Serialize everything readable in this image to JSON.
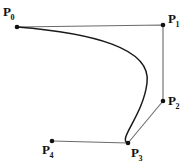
{
  "figure": {
    "type": "bezier-curve-diagram",
    "width": 187,
    "height": 167,
    "background_color": "#ffffff",
    "curve_color": "#1a1a1a",
    "polygon_color": "#6b6b6b",
    "point_color": "#111111",
    "points": [
      {
        "id": "P0",
        "letter": "P",
        "subscript": "0",
        "x": 17,
        "y": 27
      },
      {
        "id": "P1",
        "letter": "P",
        "subscript": "1",
        "x": 163,
        "y": 25
      },
      {
        "id": "P2",
        "letter": "P",
        "subscript": "2",
        "x": 163,
        "y": 101
      },
      {
        "id": "P3",
        "letter": "P",
        "subscript": "3",
        "x": 128,
        "y": 143
      },
      {
        "id": "P4",
        "letter": "P",
        "subscript": "4",
        "x": 52,
        "y": 141
      }
    ],
    "control_polygon": "17,27 163,25 163,101 128,143 52,141",
    "curve_path": "M 17 27 C 92 33 152 48 147 83 C 143 116 117 140 128 143",
    "caption": ""
  }
}
